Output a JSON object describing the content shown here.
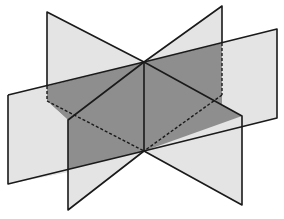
{
  "diagram": {
    "title": "",
    "colors": {
      "background": "#ffffff",
      "light_fill": "#e4e4e4",
      "dark_fill": "#8e8e8e",
      "stroke": "#1a1a1a"
    },
    "axis": {
      "top": [
        144,
        62
      ],
      "bottom": [
        144,
        151
      ]
    },
    "planes": [
      {
        "name": "back-left-plane-upper",
        "shade": "light",
        "points": [
          [
            47,
            12
          ],
          [
            144,
            62
          ],
          [
            144,
            151
          ],
          [
            47,
            101
          ]
        ]
      },
      {
        "name": "back-right-plane-upper",
        "shade": "light",
        "points": [
          [
            222,
            6
          ],
          [
            144,
            62
          ],
          [
            144,
            151
          ],
          [
            222,
            95
          ]
        ]
      },
      {
        "name": "left-wing-plane",
        "shade": "light",
        "points": [
          [
            8,
            95
          ],
          [
            144,
            62
          ],
          [
            144,
            151
          ],
          [
            8,
            184
          ]
        ]
      },
      {
        "name": "right-wing-plane",
        "shade": "light",
        "points": [
          [
            277,
            29
          ],
          [
            144,
            62
          ],
          [
            144,
            151
          ],
          [
            277,
            118
          ]
        ]
      },
      {
        "name": "front-left-plane-lower",
        "shade": "light",
        "points": [
          [
            68,
            120
          ],
          [
            144,
            62
          ],
          [
            144,
            151
          ],
          [
            68,
            210
          ]
        ]
      },
      {
        "name": "front-right-plane-lower",
        "shade": "light",
        "points": [
          [
            242,
            116
          ],
          [
            144,
            62
          ],
          [
            144,
            151
          ],
          [
            242,
            205
          ]
        ]
      }
    ],
    "dark_region": {
      "name": "shaded-inner-region",
      "points": [
        [
          47,
          101
        ],
        [
          144,
          62
        ],
        [
          222,
          95
        ],
        [
          144,
          151
        ]
      ]
    }
  }
}
